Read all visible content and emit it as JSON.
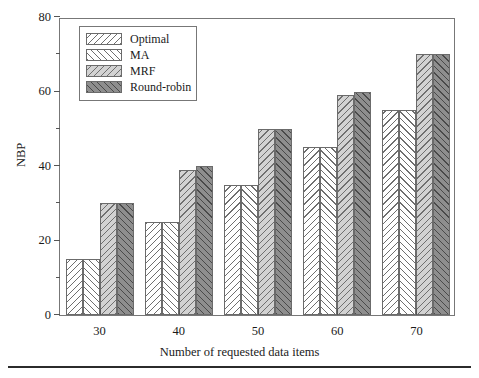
{
  "chart_data": {
    "type": "bar",
    "title": "",
    "xlabel": "Number of requested data items",
    "ylabel": "NBP",
    "categories": [
      "30",
      "40",
      "50",
      "60",
      "70"
    ],
    "series": [
      {
        "name": "Optimal",
        "values": [
          15,
          25,
          35,
          45,
          55
        ],
        "fill": "#ffffff",
        "hatch": "backslash"
      },
      {
        "name": "MA",
        "values": [
          15,
          25,
          35,
          45,
          55
        ],
        "fill": "#ffffff",
        "hatch": "forwardslash"
      },
      {
        "name": "MRF",
        "values": [
          30,
          39,
          50,
          59,
          70
        ],
        "fill": "#d2d2d2",
        "hatch": "backslash"
      },
      {
        "name": "Round-robin",
        "values": [
          30,
          40,
          50,
          60,
          70
        ],
        "fill": "#8e8e8e",
        "hatch": "forwardslash"
      }
    ],
    "ylim": [
      0,
      80
    ],
    "y_major_ticks": [
      0,
      20,
      40,
      60,
      80
    ],
    "y_minor_ticks": [
      10,
      30,
      50,
      70
    ],
    "y_tick_labels": [
      "0",
      "20",
      "40",
      "60",
      "80"
    ],
    "grid": false,
    "legend_position": "top-left",
    "frame": true
  },
  "legend": {
    "entries": [
      {
        "label": "Optimal"
      },
      {
        "label": "MA"
      },
      {
        "label": "MRF"
      },
      {
        "label": "Round-robin"
      }
    ]
  }
}
